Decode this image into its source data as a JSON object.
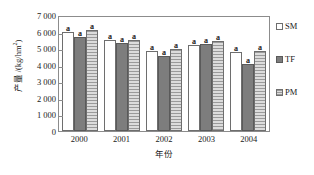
{
  "chart_data": {
    "type": "bar",
    "title": "",
    "xlabel": "年份",
    "ylabel": "产量 /(kg/hm²)",
    "ylabel_main": "产量 /(kg/hm",
    "ylabel_sup": "2",
    "ylabel_tail": ")",
    "categories": [
      "2000",
      "2001",
      "2002",
      "2003",
      "2004"
    ],
    "ylim": [
      0,
      7000
    ],
    "ytick_step": 1000,
    "yticks": [
      "7 000",
      "6 000",
      "5 000",
      "4 000",
      "3 000",
      "2 000",
      "1 000",
      "0"
    ],
    "ytick_values": [
      7000,
      6000,
      5000,
      4000,
      3000,
      2000,
      1000,
      0
    ],
    "grid": false,
    "legend_position": "right",
    "series": [
      {
        "name": "SM",
        "key": "sm",
        "color": "#ffffff",
        "values": [
          5950,
          5500,
          4800,
          5200,
          4750
        ],
        "labels": [
          "a",
          "a",
          "a",
          "a",
          "a"
        ]
      },
      {
        "name": "TF",
        "key": "tf",
        "color": "#7d7d7d",
        "values": [
          5650,
          5300,
          4500,
          5250,
          4050
        ],
        "labels": [
          "a",
          "a",
          "a",
          "a",
          "a"
        ]
      },
      {
        "name": "PM",
        "key": "pm",
        "color": "#c9c9c9",
        "values": [
          6100,
          5500,
          4950,
          5450,
          4800
        ],
        "labels": [
          "a",
          "a",
          "a",
          "a",
          "a"
        ]
      }
    ]
  },
  "legend": {
    "items": [
      {
        "label": "SM",
        "key": "sm"
      },
      {
        "label": "TF",
        "key": "tf"
      },
      {
        "label": "PM",
        "key": "pm"
      }
    ]
  }
}
